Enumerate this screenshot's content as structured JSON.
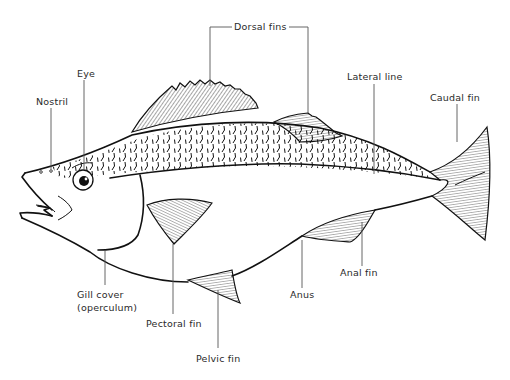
{
  "diagram": {
    "labels": {
      "dorsal_fins": "Dorsal fins",
      "eye": "Eye",
      "nostril": "Nostril",
      "lateral_line": "Lateral line",
      "caudal_fin": "Caudal fin",
      "gill_cover_1": "Gill cover",
      "gill_cover_2": "(operculum)",
      "pectoral_fin": "Pectoral fin",
      "pelvic_fin": "Pelvic fin",
      "anus": "Anus",
      "anal_fin": "Anal fin"
    },
    "colors": {
      "ink": "#111111",
      "label_text": "#2a2a2a",
      "leader_line": "#555555",
      "background": "#ffffff"
    }
  }
}
